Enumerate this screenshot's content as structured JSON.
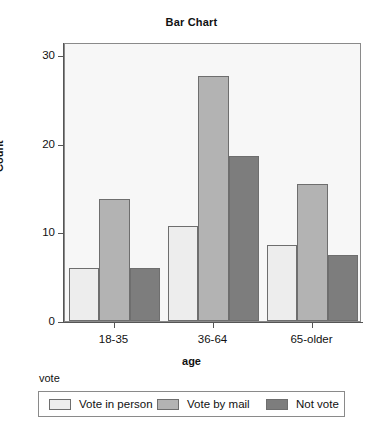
{
  "chart_data": {
    "type": "bar",
    "title": "Bar Chart",
    "xlabel": "age",
    "ylabel": "Count",
    "categories": [
      "18-35",
      "36-64",
      "65-older"
    ],
    "series": [
      {
        "name": "Vote in person",
        "values": [
          6.0,
          10.7,
          8.6
        ],
        "color": "#ededed"
      },
      {
        "name": "Vote by mail",
        "values": [
          13.8,
          27.7,
          15.5
        ],
        "color": "#b3b3b3"
      },
      {
        "name": "Not vote",
        "values": [
          6.0,
          18.6,
          7.5
        ],
        "color": "#7d7d7d"
      }
    ],
    "ylim": [
      0,
      31.5
    ],
    "yticks": [
      0,
      10,
      20,
      30
    ],
    "ytick_labels": [
      "0",
      "10",
      "20",
      "30"
    ],
    "grid": false,
    "legend_title": "vote",
    "legend_position": "bottom",
    "plot_background": "#f7f7f7",
    "axis_color": "#555555",
    "bar_border_color": "#6e6e6e"
  },
  "legend": {
    "title": "vote",
    "entries": [
      {
        "label": "Vote in person",
        "swatch": "#ededed"
      },
      {
        "label": "Vote by mail",
        "swatch": "#b3b3b3"
      },
      {
        "label": "Not vote",
        "swatch": "#7d7d7d"
      }
    ]
  }
}
